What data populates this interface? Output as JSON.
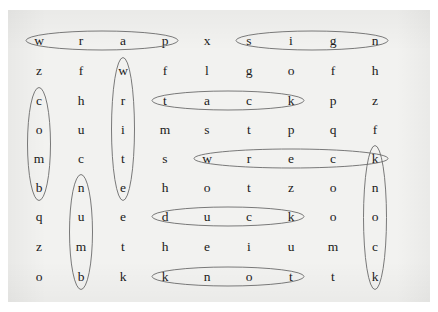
{
  "document": {
    "title": "Word Search Puzzle",
    "kind": "word-search-grid",
    "rows": 9,
    "columns": 9,
    "paper_color": "#f2f2f0",
    "ink_color": "#1a1a1a",
    "annotation_color": "#6b6b6b"
  },
  "grid": {
    "letters": [
      [
        "w",
        "r",
        "a",
        "p",
        "x",
        "s",
        "i",
        "g",
        "n"
      ],
      [
        "z",
        "f",
        "w",
        "f",
        "l",
        "g",
        "o",
        "f",
        "h"
      ],
      [
        "c",
        "h",
        "r",
        "t",
        "a",
        "c",
        "k",
        "p",
        "z"
      ],
      [
        "o",
        "u",
        "i",
        "m",
        "s",
        "t",
        "p",
        "q",
        "f"
      ],
      [
        "m",
        "c",
        "t",
        "s",
        "w",
        "r",
        "e",
        "c",
        "k"
      ],
      [
        "b",
        "n",
        "e",
        "h",
        "o",
        "t",
        "z",
        "o",
        "n"
      ],
      [
        "q",
        "u",
        "e",
        "d",
        "u",
        "c",
        "k",
        "o",
        "o"
      ],
      [
        "z",
        "m",
        "t",
        "h",
        "e",
        "i",
        "u",
        "m",
        "c"
      ],
      [
        "o",
        "b",
        "k",
        "k",
        "n",
        "o",
        "t",
        "t",
        "k"
      ]
    ]
  },
  "annotations": {
    "circled_words": [
      {
        "word": "wrap",
        "orientation": "horizontal",
        "row": 1,
        "col_start": 1,
        "col_end": 4
      },
      {
        "word": "sign",
        "orientation": "horizontal",
        "row": 1,
        "col_start": 6,
        "col_end": 9
      },
      {
        "word": "tack",
        "orientation": "horizontal",
        "row": 3,
        "col_start": 4,
        "col_end": 7
      },
      {
        "word": "wreck",
        "orientation": "horizontal",
        "row": 5,
        "col_start": 5,
        "col_end": 9
      },
      {
        "word": "duck",
        "orientation": "horizontal",
        "row": 7,
        "col_start": 4,
        "col_end": 7
      },
      {
        "word": "knot",
        "orientation": "horizontal",
        "row": 9,
        "col_start": 4,
        "col_end": 7
      },
      {
        "word": "comb",
        "orientation": "vertical",
        "col": 1,
        "row_start": 3,
        "row_end": 6
      },
      {
        "word": "numb",
        "orientation": "vertical",
        "col": 2,
        "row_start": 6,
        "row_end": 9
      },
      {
        "word": "write",
        "orientation": "vertical",
        "col": 3,
        "row_start": 2,
        "row_end": 6
      },
      {
        "word": "knock",
        "orientation": "vertical",
        "col": 9,
        "row_start": 5,
        "row_end": 9
      }
    ]
  }
}
